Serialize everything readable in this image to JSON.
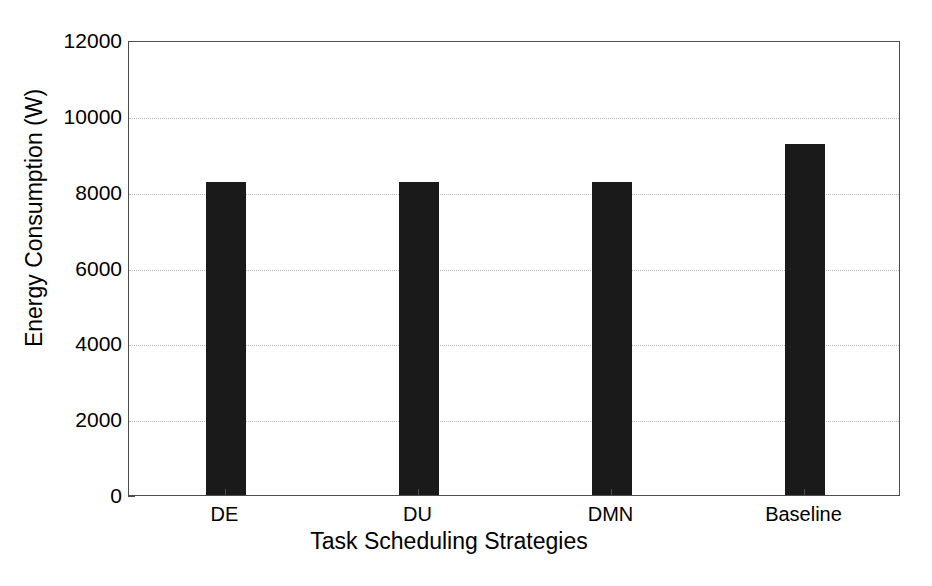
{
  "chart_data": {
    "type": "bar",
    "title": "",
    "xlabel": "Task Scheduling Strategies",
    "ylabel": "Energy Consumption (W)",
    "categories": [
      "DE",
      "DU",
      "DMN",
      "Baseline"
    ],
    "values": [
      8250,
      8250,
      8250,
      9250
    ],
    "series": [
      {
        "name": "Energy Consumption",
        "values": [
          8250,
          8250,
          8250,
          9250
        ],
        "color": "#1a1a1a"
      }
    ],
    "ylim": [
      0,
      12000
    ],
    "yticks": [
      0,
      2000,
      4000,
      6000,
      8000,
      10000,
      12000
    ],
    "ytick_labels": [
      "0",
      "2000",
      "4000",
      "6000",
      "8000",
      "10000",
      "12000"
    ],
    "xtick_labels": [
      "DE",
      "DU",
      "DMN",
      "Baseline"
    ],
    "grid": "horizontal-dotted",
    "legend": "none",
    "background_color": "#ffffff",
    "axis_color": "#4d4d4d",
    "gridline_color": "#b9b9b9"
  }
}
